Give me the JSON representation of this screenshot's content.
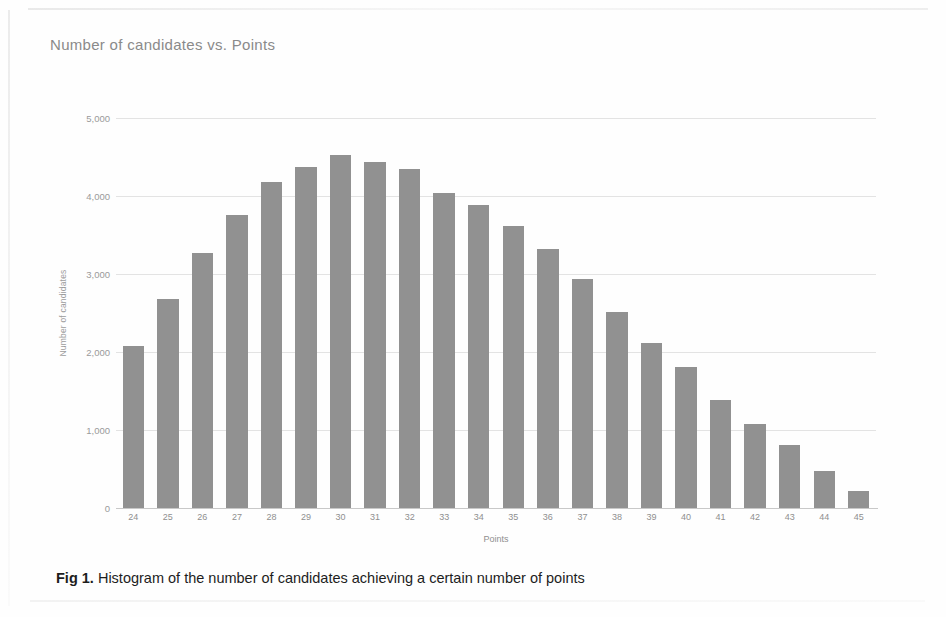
{
  "figure": {
    "caption_label": "Fig 1.",
    "caption_text": "Histogram of the number of candidates achieving a certain number of points"
  },
  "chart_data": {
    "type": "bar",
    "title": "Number of candidates vs. Points",
    "xlabel": "Points",
    "ylabel": "Number of candidates",
    "categories": [
      "24",
      "25",
      "26",
      "27",
      "28",
      "29",
      "30",
      "31",
      "32",
      "33",
      "34",
      "35",
      "36",
      "37",
      "38",
      "39",
      "40",
      "41",
      "42",
      "43",
      "44",
      "45"
    ],
    "values": [
      2080,
      2680,
      3270,
      3760,
      4180,
      4370,
      4520,
      4430,
      4350,
      4040,
      3880,
      3620,
      3320,
      2940,
      2510,
      2110,
      1810,
      1390,
      1080,
      810,
      470,
      220
    ],
    "ylim": [
      0,
      5000
    ],
    "ytick_labels": [
      "5,000",
      "4,000",
      "3,000",
      "2,000",
      "1,000",
      "0"
    ],
    "ytick_values": [
      5000,
      4000,
      3000,
      2000,
      1000,
      0
    ],
    "grid": true,
    "legend": null,
    "bar_color": "#919191",
    "grid_color": "#e3e3e3",
    "axis_color": "#c8c8c8",
    "text_color": "#8f8f8f"
  }
}
